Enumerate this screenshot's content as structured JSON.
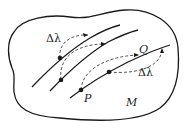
{
  "diagram": {
    "title": "",
    "manifold_label": "M",
    "points": {
      "P": "P",
      "Q": "Q"
    },
    "parameter_labels": [
      "Δλ",
      "Δλ"
    ],
    "colors": {
      "stroke": "#1a1a1a",
      "dashed": "#555555",
      "background": "#ffffff"
    },
    "elements": {
      "region": "closed blob outline representing manifold M",
      "curves": 3,
      "dots": 4,
      "dashed_arrows": 4
    }
  }
}
